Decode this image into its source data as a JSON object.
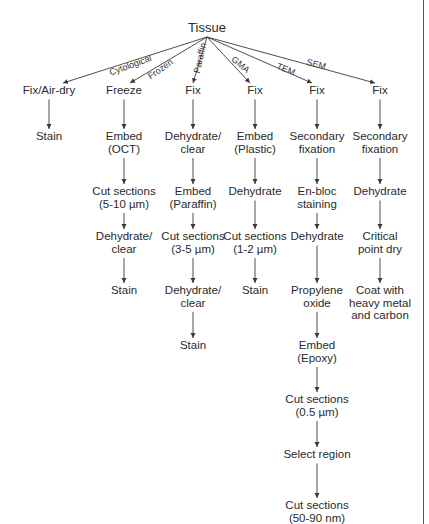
{
  "diagram": {
    "root": {
      "label": "Tissue",
      "x": 207,
      "y": 22
    },
    "branches": [
      {
        "method": "Cytological",
        "x": 49,
        "label_pos": {
          "x": 108,
          "y": 68,
          "angle": -20
        },
        "steps": [
          "Fix/Air-dry",
          "Stain"
        ]
      },
      {
        "method": "Frozen",
        "x": 124,
        "label_pos": {
          "x": 146,
          "y": 73,
          "angle": -35
        },
        "steps": [
          "Freeze",
          "Embed\n(OCT)",
          "Cut sections\n(5-10 µm)",
          "Dehydrate/\nclear",
          "Stain"
        ]
      },
      {
        "method": "Paraffin",
        "x": 193,
        "label_pos": {
          "x": 192,
          "y": 72,
          "angle": -78
        },
        "steps": [
          "Fix",
          "Dehydrate/\nclear",
          "Embed\n(Paraffin)",
          "Cut sections\n(3-5 µm)",
          "Dehydrate/\nclear",
          "Stain"
        ]
      },
      {
        "method": "GMA",
        "x": 255,
        "label_pos": {
          "x": 236,
          "y": 54,
          "angle": 40
        },
        "steps": [
          "Fix",
          "Embed\n(Plastic)",
          "Dehydrate",
          "Cut sections\n(1-2 µm)",
          "Stain"
        ]
      },
      {
        "method": "TEM",
        "x": 317,
        "label_pos": {
          "x": 279,
          "y": 61,
          "angle": 22
        },
        "steps": [
          "Fix",
          "Secondary\nfixation",
          "En-bloc\nstaining",
          "Dehydrate",
          "Propylene\noxide",
          "Embed\n(Epoxy)",
          "Cut sections\n(0.5 µm)",
          "Select region",
          "Cut sections\n(50-90 nm)"
        ]
      },
      {
        "method": "SEM",
        "x": 380,
        "label_pos": {
          "x": 308,
          "y": 57,
          "angle": 14
        },
        "steps": [
          "Fix",
          "Secondary\nfixation",
          "Dehydrate",
          "Critical\npoint dry",
          "Coat with\nheavy metal\nand carbon"
        ]
      }
    ],
    "row_y": [
      84,
      130,
      185,
      230,
      284,
      339,
      393,
      448,
      499
    ],
    "colors": {
      "line": "#3a3a3a",
      "text": "#2a2a2a",
      "border": "#555555"
    }
  }
}
